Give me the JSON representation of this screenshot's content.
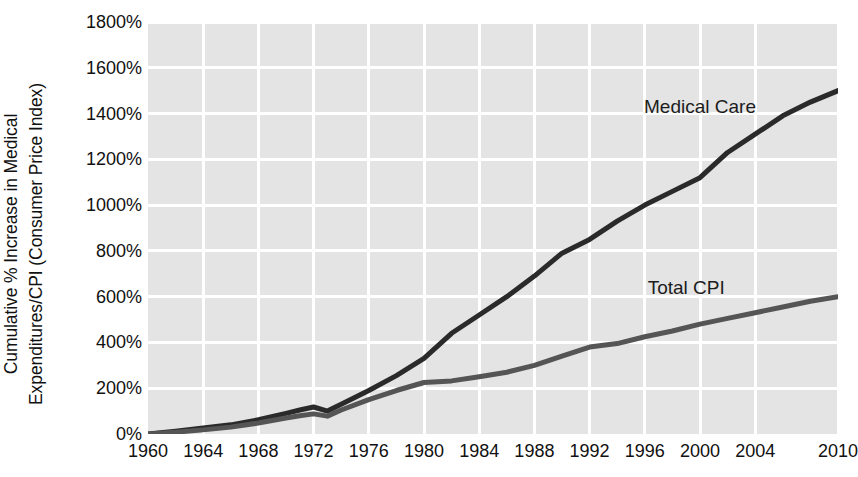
{
  "chart_data": {
    "type": "line",
    "title": "",
    "subtitle": "",
    "xlabel": "",
    "ylabel": "Cumulative % Increase in Medical Expenditures/CPI (Consumer Price Index)",
    "ylabel_lines": [
      "Cumulative % Increase in Medical",
      "Expenditures/CPI (Consumer Price Index)"
    ],
    "xlim": [
      1960,
      2010
    ],
    "ylim": [
      0,
      1800
    ],
    "ytick_values": [
      0,
      200,
      400,
      600,
      800,
      1000,
      1200,
      1400,
      1600,
      1800
    ],
    "ytick_labels": [
      "0%",
      "200%",
      "400%",
      "600%",
      "800%",
      "1000%",
      "1200%",
      "1400%",
      "1600%",
      "1800%"
    ],
    "xtick_values": [
      1960,
      1964,
      1968,
      1972,
      1976,
      1980,
      1984,
      1988,
      1992,
      1996,
      2000,
      2004,
      2010
    ],
    "xtick_labels": [
      "1960",
      "1964",
      "1968",
      "1972",
      "1976",
      "1980",
      "1984",
      "1988",
      "1992",
      "1996",
      "2000",
      "2004",
      "2010"
    ],
    "grid": true,
    "grid_color": "#ffffff",
    "panel_color": "#e4e4e4",
    "legend_position": "inline-annotations",
    "x": [
      1960,
      1962,
      1964,
      1966,
      1968,
      1970,
      1971,
      1972,
      1973,
      1974,
      1976,
      1978,
      1980,
      1982,
      1984,
      1986,
      1988,
      1990,
      1992,
      1994,
      1996,
      1998,
      2000,
      2002,
      2004,
      2006,
      2008,
      2010
    ],
    "series": [
      {
        "name": "Medical Care",
        "color": "#2a2a2a",
        "label_x": 2000,
        "label_y": 1430,
        "values": [
          0,
          12,
          26,
          40,
          62,
          90,
          105,
          118,
          100,
          130,
          190,
          255,
          330,
          440,
          520,
          600,
          690,
          790,
          850,
          930,
          1000,
          1060,
          1120,
          1230,
          1310,
          1390,
          1450,
          1500
        ]
      },
      {
        "name": "Total CPI",
        "color": "#555555",
        "label_x": 1999,
        "label_y": 640,
        "values": [
          0,
          8,
          18,
          30,
          48,
          70,
          80,
          88,
          78,
          105,
          150,
          190,
          225,
          232,
          250,
          270,
          300,
          340,
          380,
          395,
          425,
          450,
          480,
          505,
          530,
          555,
          580,
          600
        ]
      }
    ]
  }
}
